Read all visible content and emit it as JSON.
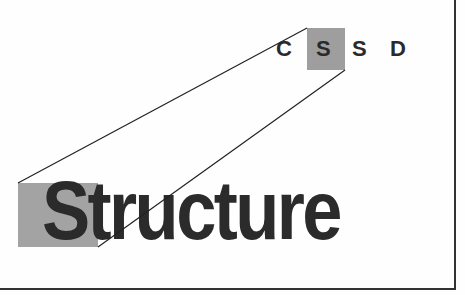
{
  "diagram": {
    "acronym_letters": [
      "C",
      "S",
      "S",
      "D"
    ],
    "highlighted_letter_index": 1,
    "word": "Structure",
    "highlight_color": "#9e9e9e",
    "text_color": "#2b2b2b",
    "line_color": "#222222"
  }
}
